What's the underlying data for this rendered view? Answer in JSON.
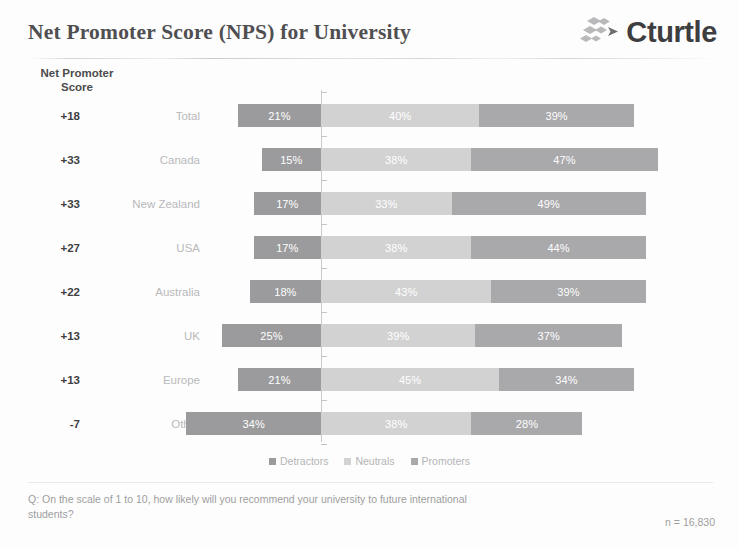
{
  "header": {
    "title": "Net Promoter Score (NPS) for University",
    "logo_text": "Cturtle",
    "logo_mark_name": "cturtle-diamonds-logo"
  },
  "axis_caption_line1": "Net Promoter",
  "axis_caption_line2": "Score",
  "legend": [
    {
      "label": "Detractors",
      "color": "#9b9b9d"
    },
    {
      "label": "Neutrals",
      "color": "#d2d2d3"
    },
    {
      "label": "Promoters",
      "color": "#a9a9ab"
    }
  ],
  "footer": {
    "question": "Q: On the scale of 1 to 10, how likely will you recommend your university to future international students?",
    "sample_size": "n = 16,830"
  },
  "chart_data": {
    "type": "bar",
    "subtype": "diverging-stacked-bar",
    "title": "Net Promoter Score (NPS) for University",
    "xlabel": "",
    "ylabel": "Net Promoter Score",
    "grid": false,
    "legend_position": "bottom",
    "categories": [
      "Total",
      "Canada",
      "New Zealand",
      "USA",
      "Australia",
      "UK",
      "Europe",
      "Other"
    ],
    "series": [
      {
        "name": "Detractors",
        "color": "#9b9b9d",
        "values": [
          21,
          15,
          17,
          17,
          18,
          25,
          21,
          34
        ]
      },
      {
        "name": "Neutrals",
        "color": "#d2d2d3",
        "values": [
          40,
          38,
          33,
          38,
          43,
          39,
          45,
          38
        ]
      },
      {
        "name": "Promoters",
        "color": "#a9a9ab",
        "values": [
          39,
          47,
          49,
          44,
          39,
          37,
          34,
          28
        ]
      }
    ],
    "nps_scores": [
      "+18",
      "+33",
      "+33",
      "+27",
      "+22",
      "+13",
      "+13",
      "-7"
    ],
    "rows": [
      {
        "score": "+18",
        "label": "Total",
        "detractors": 21,
        "neutrals": 40,
        "promoters": 39,
        "detractors_label": "21%",
        "neutrals_label": "40%",
        "promoters_label": "39%"
      },
      {
        "score": "+33",
        "label": "Canada",
        "detractors": 15,
        "neutrals": 38,
        "promoters": 47,
        "detractors_label": "15%",
        "neutrals_label": "38%",
        "promoters_label": "47%"
      },
      {
        "score": "+33",
        "label": "New Zealand",
        "detractors": 17,
        "neutrals": 33,
        "promoters": 49,
        "detractors_label": "17%",
        "neutrals_label": "33%",
        "promoters_label": "49%"
      },
      {
        "score": "+27",
        "label": "USA",
        "detractors": 17,
        "neutrals": 38,
        "promoters": 44,
        "detractors_label": "17%",
        "neutrals_label": "38%",
        "promoters_label": "44%"
      },
      {
        "score": "+22",
        "label": "Australia",
        "detractors": 18,
        "neutrals": 43,
        "promoters": 39,
        "detractors_label": "18%",
        "neutrals_label": "43%",
        "promoters_label": "39%"
      },
      {
        "score": "+13",
        "label": "UK",
        "detractors": 25,
        "neutrals": 39,
        "promoters": 37,
        "detractors_label": "25%",
        "neutrals_label": "39%",
        "promoters_label": "37%"
      },
      {
        "score": "+13",
        "label": "Europe",
        "detractors": 21,
        "neutrals": 45,
        "promoters": 34,
        "detractors_label": "21%",
        "neutrals_label": "45%",
        "promoters_label": "34%"
      },
      {
        "score": "-7",
        "label": "Other",
        "detractors": 34,
        "neutrals": 38,
        "promoters": 28,
        "detractors_label": "34%",
        "neutrals_label": "38%",
        "promoters_label": "28%"
      }
    ]
  }
}
